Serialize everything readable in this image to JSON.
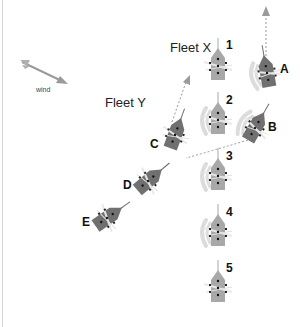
{
  "diagram": {
    "wind_label": "wind",
    "fleets": [
      {
        "name": "Fleet X",
        "label_pos": [
          170,
          51
        ],
        "color": "#a8a8a8",
        "ships": [
          {
            "id": "1",
            "x": 218,
            "y": 66,
            "angle": 0,
            "smoke": false,
            "label_pos": [
              226,
              49
            ]
          },
          {
            "id": "2",
            "x": 218,
            "y": 120,
            "angle": 0,
            "smoke": true,
            "label_pos": [
              226,
              104
            ]
          },
          {
            "id": "3",
            "x": 218,
            "y": 176,
            "angle": 0,
            "smoke": true,
            "label_pos": [
              226,
              160
            ]
          },
          {
            "id": "4",
            "x": 218,
            "y": 232,
            "angle": 0,
            "smoke": true,
            "label_pos": [
              226,
              216
            ]
          },
          {
            "id": "5",
            "x": 218,
            "y": 288,
            "angle": 0,
            "smoke": false,
            "label_pos": [
              226,
              272
            ]
          }
        ]
      },
      {
        "name": "Fleet Y",
        "label_pos": [
          105,
          106
        ],
        "color": "#707070",
        "ships": [
          {
            "id": "A",
            "x": 267,
            "y": 73,
            "angle": -10,
            "smoke": true,
            "label_pos": [
              280,
              73
            ]
          },
          {
            "id": "B",
            "x": 255,
            "y": 128,
            "angle": 30,
            "smoke": true,
            "label_pos": [
              268,
              131
            ]
          },
          {
            "id": "C",
            "x": 175,
            "y": 135,
            "angle": 20,
            "smoke": false,
            "label_pos": [
              150,
              148
            ]
          },
          {
            "id": "D",
            "x": 148,
            "y": 181,
            "angle": 50,
            "smoke": false,
            "label_pos": [
              123,
              189
            ]
          },
          {
            "id": "E",
            "x": 107,
            "y": 218,
            "angle": 55,
            "smoke": false,
            "label_pos": [
              82,
              226
            ]
          }
        ]
      }
    ],
    "colors": {
      "fleet_x_hull": "#a8a8a8",
      "fleet_y_hull": "#707070",
      "smoke": "#dcdcdc",
      "path": "#999999",
      "wind_arrow": "#9a9a9a",
      "border": "#d6d6d6"
    }
  }
}
